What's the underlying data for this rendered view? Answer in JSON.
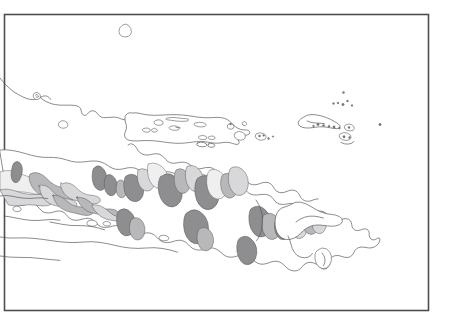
{
  "figure": {
    "kind": "outline-map",
    "background_color": "#ffffff",
    "width": 453,
    "height": 333
  },
  "frame": {
    "present": true,
    "x": 4,
    "y": 14,
    "width": 424,
    "height": 296,
    "stroke_color": "#4d4d52",
    "stroke_width": 1.6
  },
  "palette": {
    "coastline": "#5a5a5f",
    "land_fill": "#ffffff",
    "zone_dark": "#8e8e90",
    "zone_mid": "#b8b8ba",
    "zone_light": "#d8d8da",
    "zone_pale": "#efefef"
  },
  "legend": {
    "present": false,
    "items": []
  },
  "labels": {
    "present": false,
    "items": []
  },
  "scale_bar": {
    "present": false
  },
  "north_arrow": {
    "present": false
  },
  "graticule": {
    "present": false
  },
  "map_content": {
    "description": "Black and white outline map of eastern Java, Madura, Bali and the Kangean Islands with grey shaded interior zones",
    "feature_count": 7,
    "features": [
      {
        "id": "offshore-island-north",
        "type": "island",
        "shading": "none",
        "approx_center": [
          127,
          32
        ]
      },
      {
        "id": "java-mainland",
        "type": "mainland",
        "shading": "mixed",
        "approx_center": [
          160,
          215
        ]
      },
      {
        "id": "madura-island",
        "type": "island",
        "shading": "none",
        "approx_center": [
          185,
          130
        ]
      },
      {
        "id": "kangean-group",
        "type": "island-group",
        "shading": "none",
        "approx_center": [
          335,
          120
        ]
      },
      {
        "id": "bali-island",
        "type": "island",
        "shading": "partial",
        "approx_center": [
          300,
          230
        ]
      },
      {
        "id": "small-islets",
        "type": "islets",
        "shading": "partial",
        "approx_center": [
          255,
          135
        ]
      },
      {
        "id": "highland-zones",
        "type": "shaded-regions",
        "shading": "grey",
        "approx_center": [
          180,
          200
        ]
      }
    ]
  }
}
